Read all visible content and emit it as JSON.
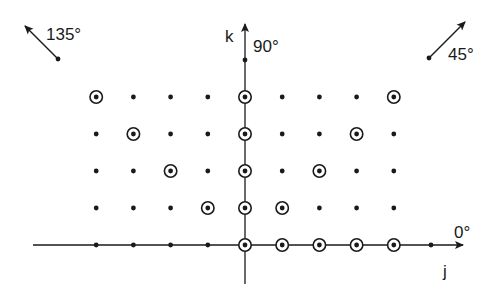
{
  "diagram": {
    "type": "lattice-directions",
    "axes": {
      "horizontal": {
        "label": "j",
        "angle_label": "0°"
      },
      "vertical": {
        "label": "k",
        "angle_label": "90°"
      }
    },
    "direction_arrows": [
      {
        "angle_label": "135°",
        "direction": "up-left"
      },
      {
        "angle_label": "45°",
        "direction": "up-right"
      }
    ],
    "grid": {
      "columns": [
        -4,
        -3,
        -2,
        -1,
        0,
        1,
        2,
        3,
        4
      ],
      "rows": [
        0,
        1,
        2,
        3,
        4
      ],
      "extra_axis_points": [
        {
          "j": 5,
          "k": 0
        },
        {
          "j": 0,
          "k": 5
        }
      ]
    },
    "circled_points": [
      {
        "j": 0,
        "k": 0
      },
      {
        "j": 1,
        "k": 0
      },
      {
        "j": 2,
        "k": 0
      },
      {
        "j": 3,
        "k": 0
      },
      {
        "j": 4,
        "k": 0
      },
      {
        "j": 0,
        "k": 1
      },
      {
        "j": 0,
        "k": 2
      },
      {
        "j": 0,
        "k": 3
      },
      {
        "j": 0,
        "k": 4
      },
      {
        "j": 1,
        "k": 1
      },
      {
        "j": 2,
        "k": 2
      },
      {
        "j": 3,
        "k": 3
      },
      {
        "j": 4,
        "k": 4
      },
      {
        "j": -1,
        "k": 1
      },
      {
        "j": -2,
        "k": 2
      },
      {
        "j": -3,
        "k": 3
      },
      {
        "j": -4,
        "k": 4
      }
    ],
    "colors": {
      "ink": "#1a1a1a",
      "background": "#ffffff"
    }
  }
}
